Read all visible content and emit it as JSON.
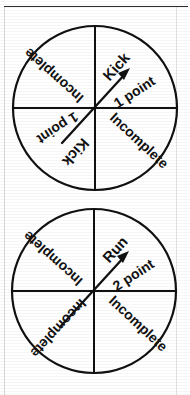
{
  "document": {
    "type": "worksheet-figure",
    "description": "Two spinner diagrams each divided into four equal sectors",
    "background_color": "#ffffff",
    "line_color": "#111111",
    "rule_color": "#2b2b2b"
  },
  "spinners": [
    {
      "name": "spinner-one",
      "center": {
        "x": 95,
        "y": 108
      },
      "radius": 82,
      "pointer": {
        "name": "spinner-needle",
        "tip_angle_deg": 40,
        "tip": {
          "x": 128,
          "y": 71
        },
        "tail": {
          "x": 62,
          "y": 143
        }
      },
      "sectors": [
        {
          "position": "top-right",
          "line1": "Kick",
          "line2": "1 point"
        },
        {
          "position": "bottom-right",
          "line1": "Incomplete",
          "line2": ""
        },
        {
          "position": "bottom-left",
          "line1": "Kick",
          "line2": "1 point"
        },
        {
          "position": "top-left",
          "line1": "Incomplete",
          "line2": ""
        }
      ]
    },
    {
      "name": "spinner-two",
      "center": {
        "x": 94,
        "y": 291
      },
      "radius": 82,
      "pointer": {
        "name": "spinner-needle",
        "tip_angle_deg": 40,
        "tip": {
          "x": 127,
          "y": 254
        },
        "tail": {
          "x": 61,
          "y": 326
        }
      },
      "sectors": [
        {
          "position": "top-right",
          "line1": "Run",
          "line2": "2 point"
        },
        {
          "position": "bottom-right",
          "line1": "Incomplete",
          "line2": ""
        },
        {
          "position": "bottom-left",
          "line1": "Incomplete",
          "line2": ""
        },
        {
          "position": "top-left",
          "line1": "Incomplete",
          "line2": ""
        }
      ]
    }
  ]
}
